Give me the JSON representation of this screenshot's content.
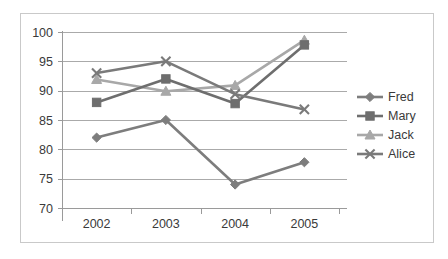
{
  "chart_data": {
    "type": "line",
    "title": "",
    "subtitle": "",
    "xlabel": "",
    "ylabel": "",
    "categories": [
      "2002",
      "2003",
      "2004",
      "2005"
    ],
    "x_tick_labels": [
      "2002",
      "2003",
      "2004",
      "2005"
    ],
    "y_tick_labels": [
      "100",
      "95",
      "90",
      "85",
      "80",
      "75",
      "70"
    ],
    "y_ticks": [
      100,
      95,
      90,
      85,
      80,
      75,
      70
    ],
    "ylim": [
      70,
      100
    ],
    "grid": "horizontal",
    "legend_position": "right",
    "series": [
      {
        "name": "Fred",
        "marker": "diamond",
        "color": "#7d7d7d",
        "values": [
          82,
          85,
          74,
          77.8
        ]
      },
      {
        "name": "Mary",
        "marker": "square",
        "color": "#6e6e6e",
        "values": [
          88,
          92,
          87.8,
          97.8
        ]
      },
      {
        "name": "Jack",
        "marker": "triangle",
        "color": "#a8a8a8",
        "values": [
          91.9,
          89.9,
          90.9,
          98.6
        ]
      },
      {
        "name": "Alice",
        "marker": "x",
        "color": "#7a7a7a",
        "values": [
          93,
          95,
          89.4,
          86.8
        ]
      }
    ]
  },
  "legend": {
    "entries": [
      {
        "label": "Fred"
      },
      {
        "label": "Mary"
      },
      {
        "label": "Jack"
      },
      {
        "label": "Alice"
      }
    ]
  },
  "colors": {
    "frame_border": "#c9c9c9",
    "gridline": "#aaaaaa",
    "axis": "#9a9a9a",
    "text": "#3a3a3a",
    "background": "#ffffff"
  }
}
